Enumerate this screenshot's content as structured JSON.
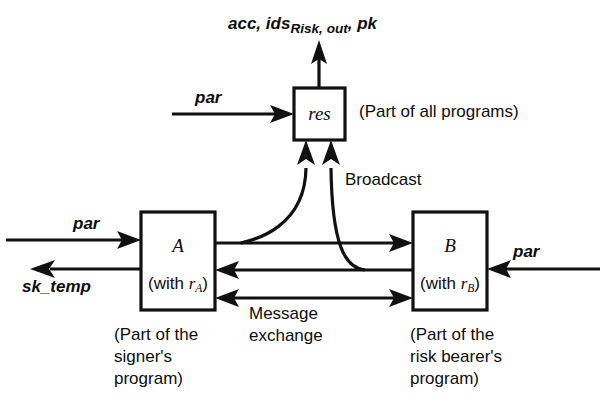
{
  "figure": {
    "type": "block-diagram",
    "background_color": "#ffffff",
    "line_color": "#111111"
  },
  "top_output": {
    "prefix": "acc, ids",
    "subscript": "Risk, out",
    "suffix": ", pk"
  },
  "boxes": [
    {
      "id": "res",
      "title": "res",
      "subtitle": "",
      "caption": "(Part of all programs)"
    },
    {
      "id": "A",
      "title": "A",
      "sub_prefix": "(with ",
      "sub_var": "r",
      "sub_index": "A",
      "sub_suffix": ")",
      "caption": "(Part of the\nsigner's\nprogram)"
    },
    {
      "id": "B",
      "title": "B",
      "sub_prefix": "(with ",
      "sub_var": "r",
      "sub_index": "B",
      "sub_suffix": ")",
      "caption": "(Part of the\nrisk bearer's\nprogram)"
    }
  ],
  "labels": {
    "par_res": "par",
    "par_a": "par",
    "par_b": "par",
    "sk_temp": "sk_temp",
    "broadcast": "Broadcast",
    "message_exchange": "Message\nexchange"
  }
}
